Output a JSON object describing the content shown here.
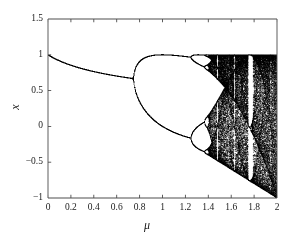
{
  "chart_data": {
    "type": "scatter",
    "title": "",
    "subtitle": "",
    "xlabel": "μ",
    "ylabel": "x",
    "xlim": [
      0,
      2
    ],
    "ylim": [
      -1,
      1.5
    ],
    "xticks": [
      0,
      0.2,
      0.4,
      0.6,
      0.8,
      1,
      1.2,
      1.4,
      1.6,
      1.8,
      2
    ],
    "xticklabels": [
      "0",
      "0.2",
      "0.4",
      "0.6",
      "0.8",
      "1",
      "1.2",
      "1.4",
      "1.6",
      "1.8",
      "2"
    ],
    "yticks": [
      -1,
      -0.5,
      0,
      0.5,
      1,
      1.5
    ],
    "yticklabels": [
      "−1",
      "−0.5",
      "0",
      "0.5",
      "1",
      "1.5"
    ],
    "grid": false,
    "legend": null,
    "point_color": "#000000",
    "axis_color": "#4d4d4d",
    "background": "#ffffff",
    "map": {
      "equation": "x_next = 1 - mu * x^2",
      "x0": 0.25,
      "transient_iterations": 320,
      "plotted_iterations": 180,
      "mu_samples": 760
    },
    "features": [
      {
        "name": "fixed-point-branch",
        "mu_range": [
          0.0,
          0.75
        ],
        "x_start": 1.03,
        "x_end": 0.655
      },
      {
        "name": "first-period-doubling",
        "mu": 0.75
      },
      {
        "name": "period-2-upper-branch",
        "mu_range": [
          0.75,
          1.25
        ],
        "x_peak": 1.0
      },
      {
        "name": "period-2-lower-branch",
        "mu_range": [
          0.75,
          1.25
        ],
        "x_min": -0.2
      },
      {
        "name": "second-period-doubling",
        "mu": 1.25
      },
      {
        "name": "chaos-onset",
        "mu": 1.401
      },
      {
        "name": "upper-envelope",
        "x": 1.0
      },
      {
        "name": "lower-envelope-line",
        "from": [
          1.4,
          0.05
        ],
        "to": [
          2.0,
          -1.0
        ]
      },
      {
        "name": "period-3-window",
        "mu_range": [
          1.75,
          1.79
        ]
      },
      {
        "name": "period-5-window",
        "mu_range": [
          1.62,
          1.64
        ]
      },
      {
        "name": "narrow-window",
        "mu_range": [
          1.47,
          1.49
        ]
      }
    ]
  },
  "axes": {
    "xtick_labels": [
      "0",
      "0.2",
      "0.4",
      "0.6",
      "0.8",
      "1",
      "1.2",
      "1.4",
      "1.6",
      "1.8",
      "2"
    ],
    "ytick_labels": [
      "1.5",
      "1",
      "0.5",
      "0",
      "−0.5",
      "−1"
    ],
    "xlabel": "μ",
    "ylabel": "x"
  }
}
